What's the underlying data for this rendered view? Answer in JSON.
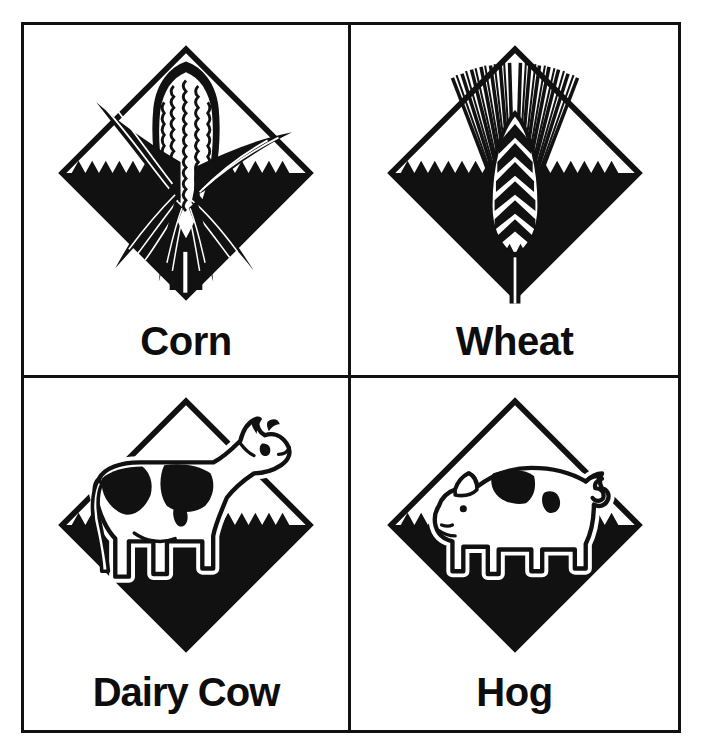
{
  "page": {
    "background_color": "#ffffff",
    "ink_color": "#111111",
    "layout": "2x2 grid of framed panels, each with a diamond emblem above a bold caption"
  },
  "frame": {
    "border_color": "#111111",
    "border_width_px": 3,
    "columns": 2,
    "rows": 2
  },
  "panels": [
    {
      "id": "corn",
      "label": "Corn",
      "icon_name": "corn-diamond-emblem",
      "position": "top-left",
      "emblem": {
        "shape": "diamond",
        "top_half": "outline",
        "bottom_half": "solid-black",
        "field_line": "sawtooth",
        "subject": "ear of corn with husk leaves"
      }
    },
    {
      "id": "wheat",
      "label": "Wheat",
      "icon_name": "wheat-diamond-emblem",
      "position": "top-right",
      "emblem": {
        "shape": "diamond",
        "top_half": "outline",
        "bottom_half": "solid-black",
        "field_line": "sawtooth",
        "subject": "wheat head with radiating awns and stem"
      }
    },
    {
      "id": "dairy-cow",
      "label": "Dairy Cow",
      "icon_name": "dairy-cow-diamond-emblem",
      "position": "bottom-left",
      "emblem": {
        "shape": "diamond",
        "top_half": "outline",
        "bottom_half": "solid-black",
        "field_line": "sawtooth",
        "subject": "standing holstein dairy cow in profile"
      }
    },
    {
      "id": "hog",
      "label": "Hog",
      "icon_name": "hog-diamond-emblem",
      "position": "bottom-right",
      "emblem": {
        "shape": "diamond",
        "top_half": "outline",
        "bottom_half": "solid-black",
        "field_line": "sawtooth",
        "subject": "standing hog in profile"
      }
    }
  ]
}
